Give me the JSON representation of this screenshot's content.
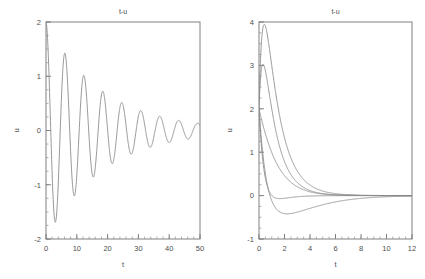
{
  "figure": {
    "background": "#ffffff",
    "axis_color": "#808080",
    "curve_color": "#8c8c8c",
    "text_color": "#4d4d4d"
  },
  "chart_data": [
    {
      "id": "left",
      "type": "line",
      "title": "t-u",
      "xlabel": "t",
      "ylabel": "u",
      "xlim": [
        0,
        50
      ],
      "ylim": [
        -2,
        2
      ],
      "xticks": [
        0,
        10,
        20,
        30,
        40,
        50
      ],
      "xticklabels": [
        "0",
        "10",
        "20",
        "30",
        "40",
        "50"
      ],
      "yticks": [
        -2,
        -1,
        0,
        1,
        2
      ],
      "yticklabels": [
        "-2",
        "-1",
        "0",
        "1",
        "2"
      ],
      "xminor_step": 2,
      "yminor_step": 0.25,
      "grid": false,
      "legend": "none",
      "series": [
        {
          "name": "damped-oscillation",
          "model": "decaying-cosine",
          "u0": 2.0,
          "amplitude": 2.0,
          "decay_rate": 0.055,
          "angular_frequency": 1.02,
          "phase": 0.0,
          "notes": "u(0)=2, first trough about -1.65 near t=3, peaks about 1.35 at t=6, 0.9 at t=12, 0.6 at t=18, 0.4 at t=25, 0.27 at t=31, 0.19 at t=37.5, 0.13 at t=44"
        }
      ]
    },
    {
      "id": "right",
      "type": "line",
      "title": "t-u",
      "xlabel": "t",
      "ylabel": "u",
      "xlim": [
        0,
        12
      ],
      "ylim": [
        -1,
        4
      ],
      "xticks": [
        0,
        2,
        4,
        6,
        8,
        10,
        12
      ],
      "xticklabels": [
        "0",
        "2",
        "4",
        "6",
        "8",
        "10",
        "12"
      ],
      "yticks": [
        -1,
        0,
        1,
        2,
        3,
        4
      ],
      "yticklabels": [
        "-1",
        "0",
        "1",
        "2",
        "3",
        "4"
      ],
      "xminor_step": 0.5,
      "yminor_step": 0.25,
      "grid": false,
      "legend": "none",
      "series": [
        {
          "name": "overshoot-1",
          "model": "overdamped-response",
          "u0": 2.0,
          "peak_value": 3.4,
          "peak_time": 0.72,
          "decay_rate": 0.82,
          "settling_time": 8.0
        },
        {
          "name": "overshoot-2",
          "model": "overdamped-response",
          "u0": 2.0,
          "peak_value": 2.58,
          "peak_time": 0.62,
          "decay_rate": 0.9,
          "settling_time": 7.5
        },
        {
          "name": "overshoot-3",
          "model": "overdamped-response",
          "u0": 2.0,
          "peak_value": 2.0,
          "peak_time": 0.1,
          "decay_rate": 1.0,
          "settling_time": 7.0
        },
        {
          "name": "monotone-decay",
          "model": "overdamped-response",
          "u0": 2.0,
          "peak_value": 0.45,
          "peak_time": 1.4,
          "decay_rate": 1.25,
          "settling_time": 7.0
        },
        {
          "name": "undershoot",
          "model": "undershoot-response",
          "u0": 2.0,
          "peak_value": -0.45,
          "peak_time": 1.8,
          "decay_rate": 1.4,
          "settling_time": 8.0
        }
      ]
    }
  ]
}
